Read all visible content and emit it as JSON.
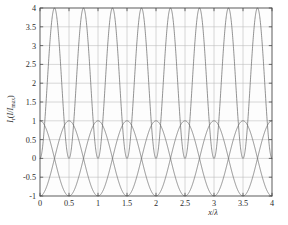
{
  "figure": {
    "background_color": "#ffffff",
    "plot_background_color": "#fdfdfd",
    "axis_color": "#4a4a4a",
    "grid_color": "#b9b9b9",
    "curve_color": "#6e6e6e"
  },
  "chart_data": {
    "type": "line",
    "title": "",
    "xlabel": "x/λ",
    "ylabel": "Iᵣ(I/Iₘₐₓ)",
    "ylabel_parts": {
      "main": "I",
      "main_sub": "r",
      "paren_open": "(",
      "num": "I",
      "slash": "/",
      "den": "I",
      "den_sub": "max",
      "paren_close": ")"
    },
    "xlabel_parts": {
      "x": "x",
      "slash": "/",
      "lambda": "λ"
    },
    "xlim": [
      0,
      4
    ],
    "ylim": [
      -1,
      4
    ],
    "xticks": [
      0,
      0.5,
      1,
      1.5,
      2,
      2.5,
      3,
      3.5,
      4
    ],
    "xticklabels": [
      "0",
      "0.5",
      "1",
      "1.5",
      "2",
      "2.5",
      "3",
      "3.5",
      "4"
    ],
    "yticks": [
      -1,
      -0.5,
      0,
      0.5,
      1,
      1.5,
      2,
      2.5,
      3,
      3.5,
      4
    ],
    "yticklabels": [
      "-1",
      "-0.5",
      "0",
      "0.5",
      "1",
      "1.5",
      "2",
      "2.5",
      "3",
      "3.5",
      "4"
    ],
    "grid": true,
    "legend": null,
    "legend_position": "none",
    "series": [
      {
        "name": "total-intensity",
        "description": "4 sin^2(2*pi*x)",
        "formula": "4*sin(2*pi*x)^2",
        "amplitude": 4,
        "period": 0.5,
        "phase": 0,
        "ymin": 0,
        "ymax": 4,
        "peaks_at": [
          0.25,
          0.75,
          1.25,
          1.75,
          2.25,
          2.75,
          3.25,
          3.75
        ],
        "zeros_at": [
          0,
          0.5,
          1,
          1.5,
          2,
          2.5,
          3,
          3.5,
          4
        ]
      },
      {
        "name": "wave-a",
        "description": "-cos(2*pi*x)",
        "formula": "-cos(2*pi*x)",
        "amplitude": 1,
        "period": 1,
        "phase": 0,
        "ymin": -1,
        "ymax": 1,
        "value_at_zero": -1,
        "peaks_at": [
          0.5,
          1.5,
          2.5,
          3.5
        ],
        "troughs_at": [
          0,
          1,
          2,
          3,
          4
        ]
      },
      {
        "name": "wave-b",
        "description": "cos(2*pi*x)",
        "formula": "cos(2*pi*x)",
        "amplitude": 1,
        "period": 1,
        "phase": 0.5,
        "ymin": -1,
        "ymax": 1,
        "value_at_zero": 1,
        "peaks_at": [
          0,
          1,
          2,
          3,
          4
        ],
        "troughs_at": [
          0.5,
          1.5,
          2.5,
          3.5
        ]
      }
    ]
  }
}
